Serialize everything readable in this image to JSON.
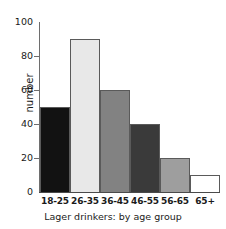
{
  "chart_data": {
    "type": "bar",
    "title": "",
    "caption": "Lager drinkers: by age group",
    "xlabel": "",
    "ylabel": "number",
    "categories": [
      "18-25",
      "26-35",
      "36-45",
      "46-55",
      "56-65",
      "65+"
    ],
    "values": [
      50,
      90,
      60,
      40,
      20,
      10
    ],
    "ylim": [
      0,
      100
    ],
    "yticks": [
      0,
      20,
      40,
      60,
      80,
      100
    ],
    "ytick_labels": [
      "0",
      "20",
      "40",
      "60",
      "80",
      "100"
    ],
    "grid": false,
    "legend": "none",
    "bar_colors": [
      "#121212",
      "#e8e8e8",
      "#828282",
      "#3a3a3a",
      "#9e9e9e",
      "#ffffff"
    ],
    "bar_border_color": "#5a5a5a",
    "axis_color": "#6e6e6e",
    "bars": [
      {
        "category": "18-25",
        "value": 50,
        "color": "#121212"
      },
      {
        "category": "26-35",
        "value": 90,
        "color": "#e8e8e8"
      },
      {
        "category": "36-45",
        "value": 60,
        "color": "#828282"
      },
      {
        "category": "46-55",
        "value": 40,
        "color": "#3a3a3a"
      },
      {
        "category": "56-65",
        "value": 20,
        "color": "#9e9e9e"
      },
      {
        "category": "65+",
        "value": 10,
        "color": "#ffffff"
      }
    ]
  }
}
